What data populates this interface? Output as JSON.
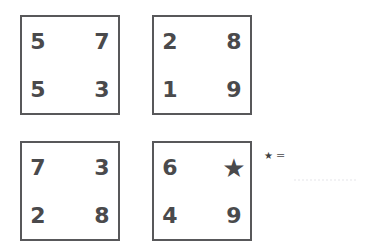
{
  "puzzle": {
    "type": "number-grid-puzzle",
    "star_symbol": "★",
    "boxes": [
      {
        "position": "top-left",
        "cells": [
          [
            "5",
            "7"
          ],
          [
            "5",
            "3"
          ]
        ]
      },
      {
        "position": "top-right",
        "cells": [
          [
            "2",
            "8"
          ],
          [
            "1",
            "9"
          ]
        ]
      },
      {
        "position": "bottom-left",
        "cells": [
          [
            "7",
            "3"
          ],
          [
            "2",
            "8"
          ]
        ]
      },
      {
        "position": "bottom-right",
        "cells": [
          [
            "6",
            "★"
          ],
          [
            "4",
            "9"
          ]
        ]
      }
    ],
    "answer": {
      "symbol": "★",
      "equals": "=",
      "value": ""
    },
    "colors": {
      "box_border": "#58585a",
      "digit": "#4a4a4c",
      "background": "#ffffff",
      "answer_line": "#f2f2f4"
    }
  }
}
